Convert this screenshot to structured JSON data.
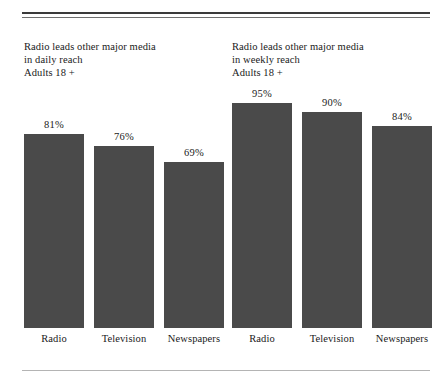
{
  "page": {
    "background_color": "#ffffff",
    "bar_color": "#4a4a4a",
    "text_color": "#1a1a1a",
    "rule_color_thick": "#3b3b3b",
    "rule_color_thin": "#6f6f6f",
    "rule_color_bottom": "#b4b4b4"
  },
  "chart_data": [
    {
      "type": "bar",
      "id": "daily-reach",
      "title": "Radio leads other major media\nin daily reach\nAdults 18 +",
      "title_lines": [
        "Radio leads other major media",
        "in daily reach",
        "Adults 18 +"
      ],
      "categories": [
        "Radio",
        "Television",
        "Newspapers"
      ],
      "values": [
        81,
        76,
        69
      ],
      "value_labels": [
        "81%",
        "76%",
        "69%"
      ],
      "xlabel": "",
      "ylabel": "",
      "ylim": [
        0,
        100
      ],
      "grid": false,
      "legend": false,
      "units": "percent"
    },
    {
      "type": "bar",
      "id": "weekly-reach",
      "title": "Radio leads other major media\nin weekly reach\nAdults 18 +",
      "title_lines": [
        "Radio leads other major media",
        "in weekly reach",
        "Adults 18 +"
      ],
      "categories": [
        "Radio",
        "Television",
        "Newspapers"
      ],
      "values": [
        95,
        90,
        84
      ],
      "value_labels": [
        "95%",
        "90%",
        "84%"
      ],
      "xlabel": "",
      "ylabel": "",
      "ylim": [
        0,
        100
      ],
      "grid": false,
      "legend": false,
      "units": "percent"
    }
  ]
}
